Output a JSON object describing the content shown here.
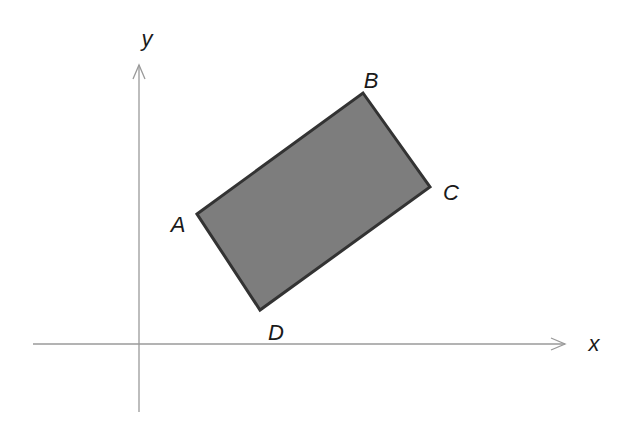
{
  "diagram": {
    "type": "coordinate-plane-rectangle",
    "colors": {
      "axis": "#9a9a9a",
      "fill": "#7d7d7d",
      "stroke": "#333333",
      "label": "#1a1a1a"
    },
    "axes": {
      "origin": [
        139,
        344
      ],
      "x": {
        "label": "x",
        "from": [
          33,
          344
        ],
        "to": [
          565,
          344
        ],
        "label_pos": [
          594,
          345
        ]
      },
      "y": {
        "label": "y",
        "from": [
          139,
          412
        ],
        "to": [
          139,
          65
        ],
        "label_pos": [
          147,
          40
        ]
      }
    },
    "rectangle": {
      "name": "ABCD",
      "vertices": [
        {
          "label": "A",
          "point": [
            197,
            214
          ],
          "label_pos": [
            178,
            226
          ]
        },
        {
          "label": "B",
          "point": [
            363,
            93
          ],
          "label_pos": [
            371,
            82
          ]
        },
        {
          "label": "C",
          "point": [
            430,
            187
          ],
          "label_pos": [
            451,
            194
          ]
        },
        {
          "label": "D",
          "point": [
            260,
            310
          ],
          "label_pos": [
            276,
            334
          ]
        }
      ]
    }
  }
}
